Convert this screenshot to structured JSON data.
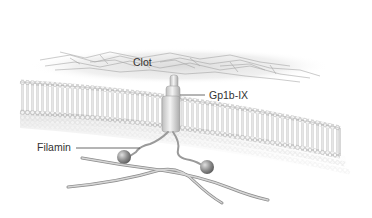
{
  "figure": {
    "labels": {
      "clot": "Clot",
      "receptor": "Gp1b-IX",
      "filamin": "Filamin"
    },
    "colors": {
      "background": "#ffffff",
      "clot": "#9a9a9a",
      "membrane_head": "#e6e6e6",
      "membrane_outline": "#9c9c9c",
      "receptor": "#d9d9d9",
      "filament": "#a8a8a8",
      "ball": "#8a8a8a",
      "text": "#333333",
      "leader_line": "#444444"
    }
  }
}
